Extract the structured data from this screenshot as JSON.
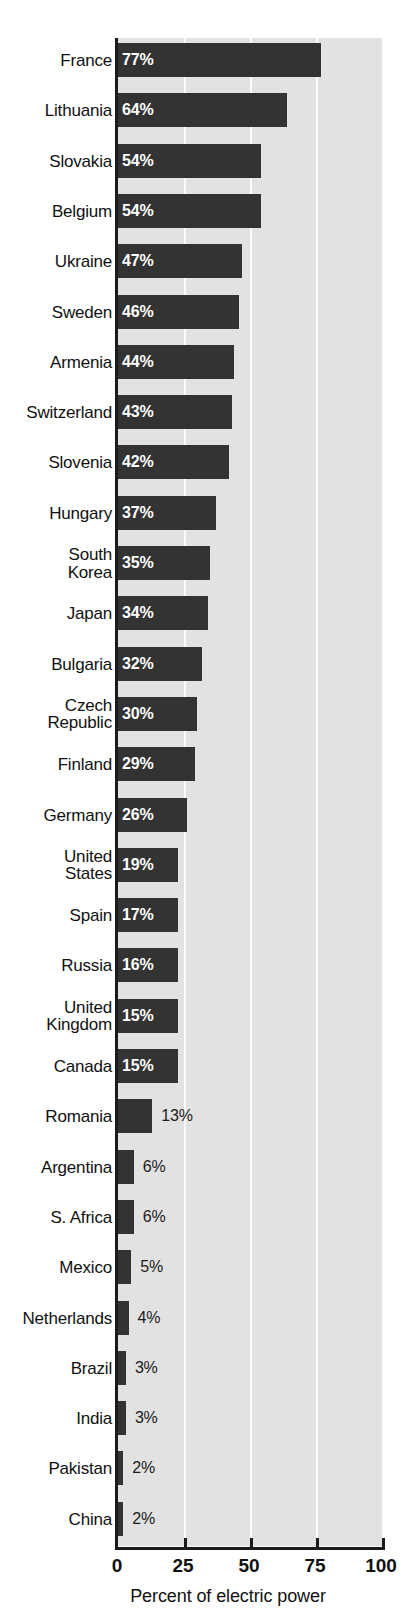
{
  "chart_data": {
    "type": "bar",
    "orientation": "horizontal",
    "title": "",
    "xlabel": "Percent of electric power",
    "ylabel": "",
    "xlim": [
      0,
      100
    ],
    "xticks": [
      0,
      25,
      50,
      75,
      100
    ],
    "xtick_labels": [
      "0",
      "25",
      "50",
      "75",
      "100"
    ],
    "grid": true,
    "gridlines_at": [
      25,
      50,
      75
    ],
    "legend": null,
    "value_suffix": "%",
    "categories": [
      "France",
      "Lithuania",
      "Slovakia",
      "Belgium",
      "Ukraine",
      "Sweden",
      "Armenia",
      "Switzerland",
      "Slovenia",
      "Hungary",
      "South\nKorea",
      "Japan",
      "Bulgaria",
      "Czech\nRepublic",
      "Finland",
      "Germany",
      "United\nStates",
      "Spain",
      "Russia",
      "United\nKingdom",
      "Canada",
      "Romania",
      "Argentina",
      "S. Africa",
      "Mexico",
      "Netherlands",
      "Brazil",
      "India",
      "Pakistan",
      "China"
    ],
    "values": [
      77,
      64,
      54,
      54,
      47,
      46,
      44,
      43,
      42,
      37,
      35,
      34,
      32,
      30,
      29,
      26,
      19,
      17,
      16,
      15,
      15,
      13,
      6,
      6,
      5,
      4,
      3,
      3,
      2,
      2
    ],
    "value_labels": [
      "77%",
      "64%",
      "54%",
      "54%",
      "47%",
      "46%",
      "44%",
      "43%",
      "42%",
      "37%",
      "35%",
      "34%",
      "32%",
      "30%",
      "29%",
      "26%",
      "19%",
      "17%",
      "16%",
      "15%",
      "15%",
      "13%",
      "6%",
      "6%",
      "5%",
      "4%",
      "3%",
      "3%",
      "2%",
      "2%"
    ],
    "label_inside": [
      true,
      true,
      true,
      true,
      true,
      true,
      true,
      true,
      true,
      true,
      true,
      true,
      true,
      true,
      true,
      true,
      true,
      true,
      true,
      true,
      true,
      false,
      false,
      false,
      false,
      false,
      false,
      false,
      false,
      false
    ],
    "colors": {
      "bar": "#333333",
      "plot_background": "#e2e2e2",
      "gridline": "#fbfbfb",
      "axis": "#1b1b1b",
      "label_inside_text": "#ffffff",
      "label_outside_text": "#1b1b1b",
      "page_background": "#ffffff"
    }
  }
}
